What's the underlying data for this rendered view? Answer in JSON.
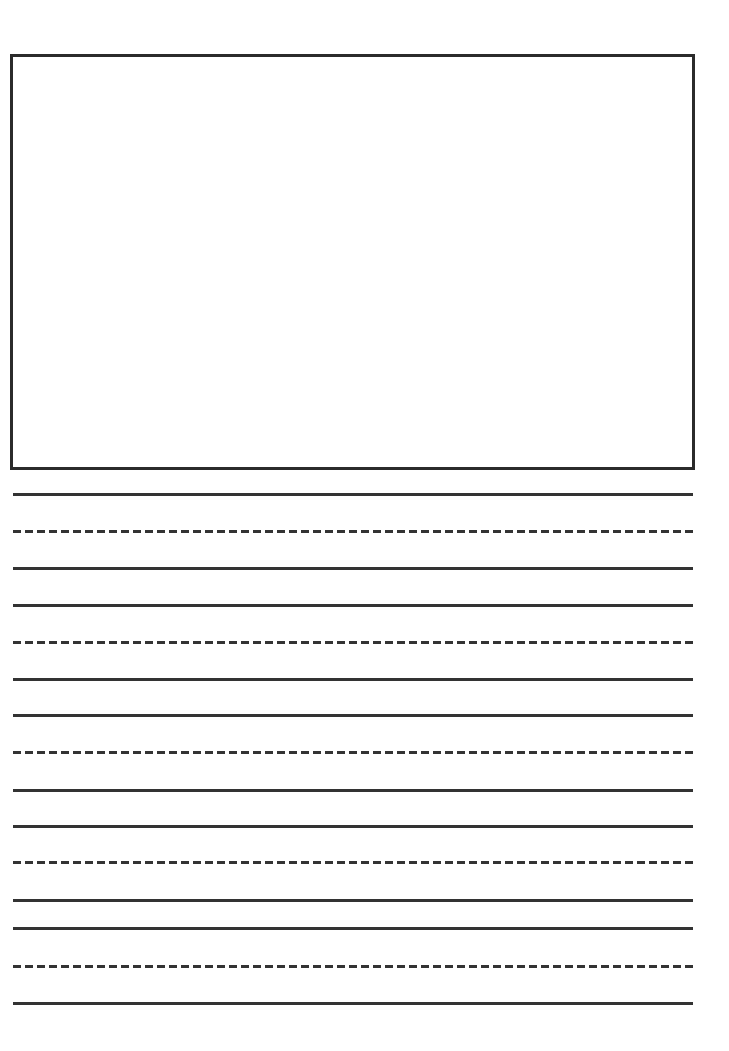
{
  "page": {
    "type": "primary writing paper",
    "drawing_box": {
      "label": ""
    },
    "line_groups": [
      {
        "lines": [
          {
            "y": 493,
            "style": "solid"
          },
          {
            "y": 530,
            "style": "dashed"
          },
          {
            "y": 567,
            "style": "solid"
          }
        ]
      },
      {
        "lines": [
          {
            "y": 604,
            "style": "solid"
          },
          {
            "y": 641,
            "style": "dashed"
          },
          {
            "y": 678,
            "style": "solid"
          }
        ]
      },
      {
        "lines": [
          {
            "y": 714,
            "style": "solid"
          },
          {
            "y": 751,
            "style": "dashed"
          },
          {
            "y": 789,
            "style": "solid"
          }
        ]
      },
      {
        "lines": [
          {
            "y": 825,
            "style": "solid"
          },
          {
            "y": 861,
            "style": "dashed"
          },
          {
            "y": 899,
            "style": "solid"
          }
        ]
      },
      {
        "lines": [
          {
            "y": 927,
            "style": "solid"
          },
          {
            "y": 965,
            "style": "dashed"
          },
          {
            "y": 1002,
            "style": "solid"
          }
        ]
      }
    ],
    "line_color": "#333333"
  }
}
